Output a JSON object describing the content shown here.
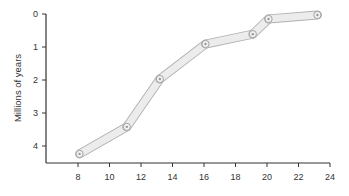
{
  "chart_data": {
    "type": "line",
    "title": "",
    "xlabel": "",
    "ylabel": "Millions of years",
    "xlim": [
      6.9,
      24
    ],
    "ylim": [
      4.5,
      0
    ],
    "y_inverted": true,
    "grid": false,
    "legend": null,
    "x_ticks": [
      8,
      10,
      12,
      14,
      16,
      18,
      20,
      22,
      24
    ],
    "y_ticks": [
      0,
      1,
      2,
      3,
      4
    ],
    "series": [
      {
        "name": "segments",
        "style": "thick light-gray band with circular joint markers",
        "x": [
          8.1,
          11.1,
          13.2,
          16.1,
          19.1,
          20.1,
          23.2
        ],
        "y": [
          4.24,
          3.42,
          1.97,
          0.91,
          0.61,
          0.15,
          0.03
        ]
      }
    ],
    "colors": {
      "axis": "#333333",
      "band_fill": "#ececec",
      "band_stroke": "#b0b0b0",
      "marker": "#9a9a9a"
    }
  }
}
